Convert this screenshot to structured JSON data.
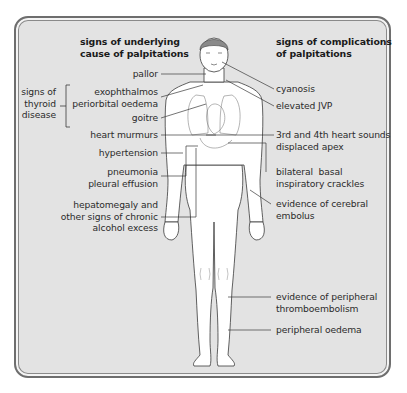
{
  "headings": {
    "left": "signs of underlying\ncause of palpitations",
    "right": "signs of complications\nof palpitations"
  },
  "bracket_group": {
    "label": "signs of\nthyroid\ndisease"
  },
  "left_labels": [
    {
      "id": "pallor",
      "text": "pallor"
    },
    {
      "id": "exophthalmos",
      "text": "exophthalmos\nperiorbital oedema"
    },
    {
      "id": "goitre",
      "text": "goitre"
    },
    {
      "id": "heart-murmurs",
      "text": "heart murmurs"
    },
    {
      "id": "hypertension",
      "text": "hypertension"
    },
    {
      "id": "pneumonia",
      "text": "pneumonia\npleural effusion"
    },
    {
      "id": "hepatomegaly",
      "text": "hepatomegaly and\nother signs of chronic\nalcohol excess"
    }
  ],
  "right_labels": [
    {
      "id": "cyanosis",
      "text": "cyanosis"
    },
    {
      "id": "elevated-jvp",
      "text": "elevated JVP"
    },
    {
      "id": "heart-sounds",
      "text": "3rd and 4th heart sounds\ndisplaced apex"
    },
    {
      "id": "crackles",
      "text": "bilateral  basal\ninspiratory crackles"
    },
    {
      "id": "cerebral-embolus",
      "text": "evidence of cerebral\nembolus"
    },
    {
      "id": "thromboembolism",
      "text": "evidence of peripheral\nthromboembolism"
    },
    {
      "id": "peripheral-oedema",
      "text": "peripheral oedema"
    }
  ],
  "colors": {
    "panel_bg": "#e3e3e3",
    "border": "#6e6e6e",
    "body_fill": "#ffffff",
    "line": "#3a3a3a",
    "hair": "#8a8a8a"
  }
}
